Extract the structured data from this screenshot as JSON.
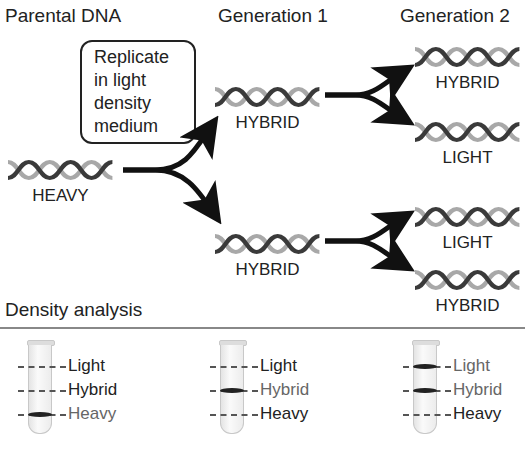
{
  "headers": {
    "parental": "Parental DNA",
    "gen1": "Generation 1",
    "gen2": "Generation 2",
    "density": "Density analysis"
  },
  "instruction_box": {
    "lines": [
      "Replicate",
      "in light",
      "density",
      "medium"
    ]
  },
  "molecules": {
    "parental": {
      "label": "HEAVY",
      "icon": "dna-helix-icon"
    },
    "gen1": [
      {
        "label": "HYBRID",
        "icon": "dna-helix-icon"
      },
      {
        "label": "HYBRID",
        "icon": "dna-helix-icon"
      }
    ],
    "gen2": [
      {
        "label": "HYBRID",
        "icon": "dna-helix-icon"
      },
      {
        "label": "LIGHT",
        "icon": "dna-helix-icon"
      },
      {
        "label": "LIGHT",
        "icon": "dna-helix-icon"
      },
      {
        "label": "HYBRID",
        "icon": "dna-helix-icon"
      }
    ]
  },
  "tubes": [
    {
      "name": "parental",
      "bands": [
        "Heavy"
      ],
      "labels": [
        "Light",
        "Hybrid",
        "Heavy"
      ]
    },
    {
      "name": "generation-1",
      "bands": [
        "Hybrid"
      ],
      "labels": [
        "Light",
        "Hybrid",
        "Heavy"
      ]
    },
    {
      "name": "generation-2",
      "bands": [
        "Light",
        "Hybrid"
      ],
      "labels": [
        "Light",
        "Hybrid",
        "Heavy"
      ]
    }
  ],
  "colors": {
    "strand_dark": "#3a3a3a",
    "strand_light": "#a8a8a8",
    "arrow": "#111111",
    "band": "#222222"
  }
}
